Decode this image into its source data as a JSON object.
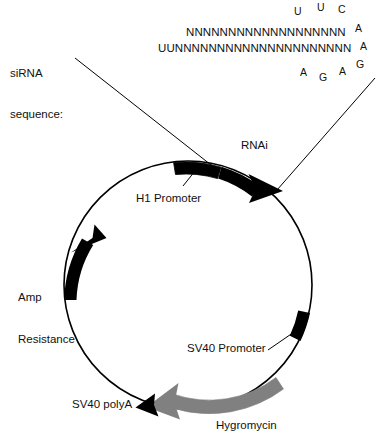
{
  "figure": {
    "type": "plasmid-map",
    "title_visible": false
  },
  "sirna": {
    "label_line1": "siRNA",
    "label_line2": "sequence:",
    "sense_strand": "NNNNNNNNNNNNNNNNNNN",
    "antisense_strand": "UUNNNNNNNNNNNNNNNNNNNNN",
    "loop_top": [
      "U",
      "U",
      "C"
    ],
    "loop_right": [
      "A",
      "A",
      "G"
    ],
    "loop_bottom": [
      "A",
      "G",
      "A"
    ]
  },
  "plasmid": {
    "features": [
      {
        "name": "h1-promoter",
        "label": "H1 Promoter",
        "style": "box",
        "color": "#000000"
      },
      {
        "name": "rnai",
        "label": "RNAi",
        "style": "arrow",
        "color": "#000000"
      },
      {
        "name": "amp-resistance",
        "label_line1": "Amp",
        "label_line2": "Resistance",
        "style": "arc-arrow",
        "color": "#000000"
      },
      {
        "name": "sv40-promoter",
        "label": "SV40 Promoter",
        "style": "arc-block",
        "color": "#000000"
      },
      {
        "name": "hygromycin",
        "label": "Hygromycin",
        "style": "arrow",
        "color": "#808080"
      },
      {
        "name": "sv40-polya",
        "label": "SV40 polyA",
        "style": "arrowhead",
        "color": "#000000"
      }
    ],
    "backbone_color": "#000000"
  }
}
